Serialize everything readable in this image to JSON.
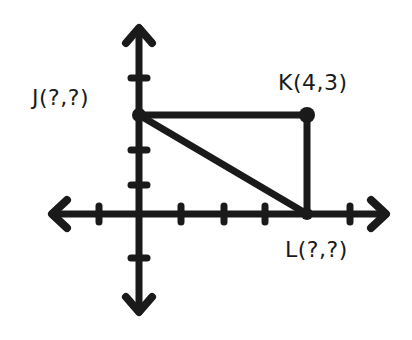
{
  "diagram": {
    "type": "coordinate-plane-right-triangle",
    "colors": {
      "stroke": "#1a1a1a",
      "background": "#ffffff"
    },
    "points": [
      {
        "id": "J",
        "label": "J(?,?)",
        "coords": [
          0,
          3
        ],
        "known": false
      },
      {
        "id": "K",
        "label": "K(4,3)",
        "coords": [
          4,
          3
        ],
        "known": true
      },
      {
        "id": "L",
        "label": "L(?,?)",
        "coords": [
          4,
          0
        ],
        "known": false
      }
    ],
    "axes": {
      "x_ticks": [
        -1,
        1,
        2,
        3,
        4,
        5
      ],
      "y_ticks": [
        -1,
        1,
        2,
        3,
        4
      ]
    },
    "segments": [
      "JK",
      "KL",
      "JL"
    ]
  }
}
